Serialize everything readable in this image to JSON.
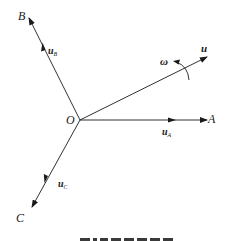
{
  "diagram": {
    "type": "vector-diagram",
    "colors": {
      "stroke": "#1a1a1a",
      "background": "#ffffff"
    },
    "origin": {
      "label": "O",
      "x": 80,
      "y": 120
    },
    "axes": [
      {
        "id": "A",
        "label": "A",
        "unit_vector": "u",
        "unit_subscript": "A",
        "end": [
          207,
          120
        ]
      },
      {
        "id": "B",
        "label": "B",
        "unit_vector": "u",
        "unit_subscript": "B",
        "end": [
          29,
          18
        ]
      },
      {
        "id": "C",
        "label": "C",
        "unit_vector": "u",
        "unit_subscript": "C",
        "end": [
          32,
          207
        ]
      }
    ],
    "rotating_vector": {
      "label": "u",
      "end": [
        207,
        57
      ]
    },
    "rotation": {
      "label": "ω",
      "direction": "counter-clockwise"
    },
    "caption_visible": "partially cut off (illegible)"
  }
}
